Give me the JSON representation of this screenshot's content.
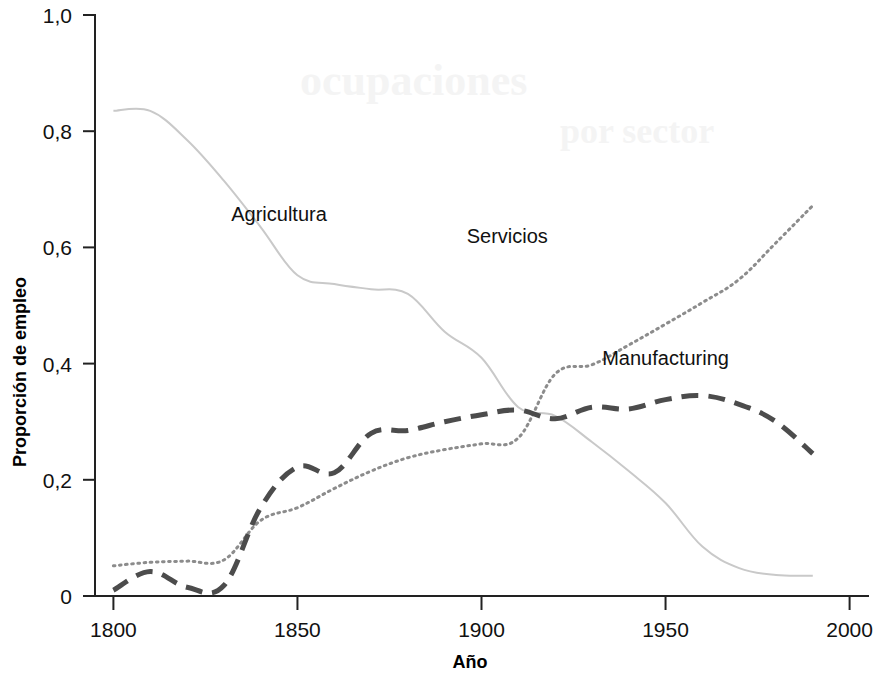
{
  "chart_data": {
    "type": "line",
    "title": "",
    "subtitle": "",
    "xlabel": "Año",
    "ylabel": "Proporción de empleo",
    "xlim": [
      1795,
      2005
    ],
    "ylim": [
      0,
      1.0
    ],
    "grid": false,
    "legend_position": "inline-annotations",
    "x_ticks": [
      "1800",
      "1850",
      "1900",
      "1950",
      "2000"
    ],
    "x_tick_values": [
      1800,
      1850,
      1900,
      1950,
      2000
    ],
    "y_ticks": [
      "0",
      "0,2",
      "0,4",
      "0,6",
      "0,8",
      "1,0"
    ],
    "y_tick_values": [
      0,
      0.2,
      0.4,
      0.6,
      0.8,
      1.0
    ],
    "x": [
      1800,
      1810,
      1820,
      1830,
      1840,
      1850,
      1860,
      1870,
      1880,
      1890,
      1900,
      1910,
      1920,
      1930,
      1940,
      1950,
      1960,
      1970,
      1980,
      1990
    ],
    "series": [
      {
        "name": "Agricultura",
        "style": "solid",
        "color": "#c9c9c9",
        "width": 2,
        "label_x": 1845,
        "label_y": 0.645,
        "values": [
          0.835,
          0.835,
          0.785,
          0.715,
          0.635,
          0.552,
          0.537,
          0.528,
          0.52,
          0.455,
          0.41,
          0.325,
          0.31,
          0.265,
          0.215,
          0.16,
          0.085,
          0.048,
          0.036,
          0.035
        ]
      },
      {
        "name": "Servicios",
        "style": "dotted",
        "color": "#8c8c8c",
        "width": 3,
        "label_x": 1907,
        "label_y": 0.608,
        "values": [
          0.052,
          0.058,
          0.06,
          0.062,
          0.13,
          0.152,
          0.185,
          0.215,
          0.238,
          0.252,
          0.262,
          0.272,
          0.382,
          0.398,
          0.432,
          0.468,
          0.505,
          0.545,
          0.608,
          0.672
        ]
      },
      {
        "name": "Manufacturing",
        "style": "dashed",
        "color": "#4c4c4c",
        "width": 5,
        "label_x": 1950,
        "label_y": 0.398,
        "values": [
          0.01,
          0.042,
          0.015,
          0.018,
          0.152,
          0.222,
          0.212,
          0.28,
          0.285,
          0.3,
          0.312,
          0.32,
          0.305,
          0.325,
          0.322,
          0.338,
          0.345,
          0.33,
          0.3,
          0.245
        ]
      }
    ],
    "annotations": [
      {
        "text": "Agricultura",
        "series": "Agricultura"
      },
      {
        "text": "Servicios",
        "series": "Servicios"
      },
      {
        "text": "Manufacturing",
        "series": "Manufacturing"
      }
    ]
  }
}
